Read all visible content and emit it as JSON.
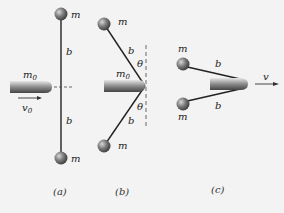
{
  "panels": [
    {
      "id": "a",
      "caption": "(a)",
      "labels": {
        "mass_top": "m",
        "mass_bottom": "m",
        "rod_top": "b",
        "rod_bottom": "b",
        "projectile_mass": "m",
        "projectile_mass_sub": "0",
        "velocity": "v",
        "velocity_sub": "0"
      }
    },
    {
      "id": "b",
      "caption": "(b)",
      "labels": {
        "mass_top": "m",
        "mass_bottom": "m",
        "rod_top": "b",
        "rod_bottom": "b",
        "angle_top": "θ",
        "angle_bottom": "θ",
        "projectile_mass": "m",
        "projectile_mass_sub": "0"
      }
    },
    {
      "id": "c",
      "caption": "(c)",
      "labels": {
        "mass_top": "m",
        "mass_bottom": "m",
        "rod_top": "b",
        "rod_bottom": "b",
        "velocity": "v"
      }
    }
  ],
  "colors": {
    "background": "#f2f3f2",
    "rod": "#222222",
    "ball": "#6f6f6f",
    "projectile": "#8a8a8a"
  }
}
